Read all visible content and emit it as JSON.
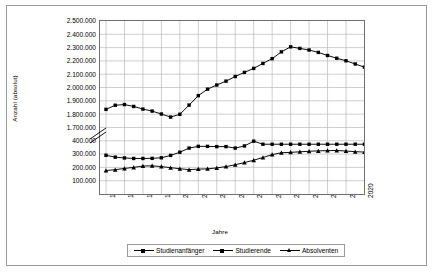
{
  "axes": {
    "ylabel": "Anzahl (absolut)",
    "xlabel": "Jahre",
    "yticks_upper": [
      "2.500.000",
      "2.400.000",
      "2.300.000",
      "2.200.000",
      "2.100.000",
      "2.000.000",
      "1.900.000",
      "1.800.000",
      "1.700.000"
    ],
    "yticks_lower": [
      "400.000",
      "300.000",
      "200.000",
      "100.000"
    ],
    "xticks": [
      "1992",
      "1994",
      "1996",
      "1998",
      "2000",
      "2002",
      "2004",
      "2006",
      "2008",
      "2010",
      "2012",
      "2014",
      "2016",
      "2018",
      "2020"
    ]
  },
  "legend": {
    "items": [
      {
        "label": "Studienanfänger",
        "marker": "square"
      },
      {
        "label": "Studierende",
        "marker": "square"
      },
      {
        "label": "Absolventen",
        "marker": "triangle"
      }
    ]
  },
  "colors": {
    "line": "#000000",
    "grid": "#b9b9b9",
    "axis": "#6f6f6f",
    "frame": "#9a9a9a",
    "background": "#ffffff"
  },
  "chart_data": {
    "type": "line",
    "title": "",
    "xlabel": "Jahre",
    "ylabel": "Anzahl (absolut)",
    "axis_break": {
      "between": [
        400000,
        1700000
      ],
      "note": "y-Achse unterbrochen"
    },
    "ylim_lower": [
      0,
      400000
    ],
    "ylim_upper": [
      1700000,
      2500000
    ],
    "grid": true,
    "legend_position": "bottom",
    "x": [
      1992,
      1993,
      1994,
      1995,
      1996,
      1997,
      1998,
      1999,
      2000,
      2001,
      2002,
      2003,
      2004,
      2005,
      2006,
      2007,
      2008,
      2009,
      2010,
      2011,
      2012,
      2013,
      2014,
      2015,
      2016,
      2017,
      2018,
      2019,
      2020
    ],
    "series": [
      {
        "name": "Studierende",
        "marker": "square",
        "values": [
          1836000,
          1867000,
          1872000,
          1858000,
          1838000,
          1823000,
          1801000,
          1778000,
          1799000,
          1868000,
          1939000,
          1988000,
          2019000,
          2048000,
          2083000,
          2114000,
          2144000,
          2181000,
          2217000,
          2268000,
          2306000,
          2294000,
          2282000,
          2264000,
          2241000,
          2220000,
          2201000,
          2177000,
          2153000
        ]
      },
      {
        "name": "Studienanfänger",
        "marker": "square",
        "values": [
          291000,
          277000,
          271000,
          267000,
          267000,
          268000,
          272000,
          290000,
          314000,
          345000,
          358000,
          358000,
          356000,
          356000,
          345000,
          361000,
          397000,
          425000,
          443000,
          518000,
          496000,
          508000,
          505000,
          506000,
          509000,
          514000,
          512000,
          509000,
          489000
        ]
      },
      {
        "name": "Absolventen",
        "marker": "triangle",
        "values": [
          176000,
          183000,
          192000,
          200000,
          210000,
          212000,
          206000,
          198000,
          190000,
          183000,
          187000,
          189000,
          196000,
          206000,
          220000,
          236000,
          254000,
          274000,
          296000,
          310000,
          313000,
          317000,
          321000,
          324000,
          326000,
          327000,
          323000,
          318000,
          315000
        ]
      }
    ],
    "series_display_note": "Studienanfänger und Absolventen auf unterem Achsenabschnitt (100.000–400.000); Studierende auf oberem Abschnitt (1.700.000–2.500.000)"
  }
}
